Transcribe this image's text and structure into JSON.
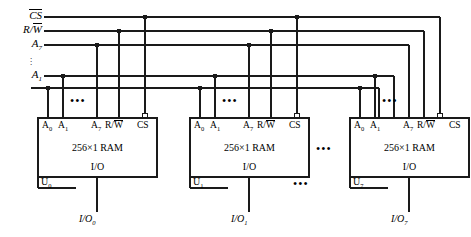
{
  "diagram": {
    "ink_color": "#1a1a1a",
    "bus_labels": [
      {
        "id": "cs",
        "text": "CS",
        "overbar_all": true,
        "y": 17
      },
      {
        "id": "rw",
        "text": "R/W",
        "overbar_w": true,
        "y": 31
      },
      {
        "id": "a7",
        "text": "A",
        "sub": "7",
        "y": 45
      },
      {
        "id": "a1",
        "text": "A",
        "sub": "1",
        "y": 76
      }
    ],
    "vertical_dots": "⋮",
    "vdots_glyph": ".",
    "blocks": [
      {
        "id": "u0",
        "ref": "U",
        "ref_sub": "0",
        "body": "256×1 RAM",
        "io_text": "I/O",
        "out_label": "I/O",
        "out_sub": "0",
        "pins": [
          "A",
          "A",
          "A",
          "R/W",
          "CS"
        ],
        "pin_labels": [
          {
            "text": "A",
            "sub": "0"
          },
          {
            "text": "A",
            "sub": "1"
          },
          {
            "text": "A",
            "sub": "7"
          },
          {
            "text": "R/W",
            "overbar_w": true
          },
          {
            "text": "CS",
            "bubble": true
          }
        ],
        "x": 38,
        "y": 118,
        "w": 119,
        "h": 59
      },
      {
        "id": "u1",
        "ref": "U",
        "ref_sub": "1",
        "body": "256×1 RAM",
        "io_text": "I/O",
        "out_label": "I/O",
        "out_sub": "1",
        "pin_labels": [
          {
            "text": "A",
            "sub": "0"
          },
          {
            "text": "A",
            "sub": "1"
          },
          {
            "text": "A",
            "sub": "7"
          },
          {
            "text": "R/W",
            "overbar_w": true
          },
          {
            "text": "CS",
            "bubble": true
          }
        ],
        "x": 190,
        "y": 118,
        "w": 119,
        "h": 59
      },
      {
        "id": "u7",
        "ref": "U",
        "ref_sub": "7",
        "body": "256×1 RAM",
        "io_text": "I/O",
        "out_label": "I/O",
        "out_sub": "7",
        "pin_labels": [
          {
            "text": "A",
            "sub": "0"
          },
          {
            "text": "A",
            "sub": "1"
          },
          {
            "text": "A",
            "sub": "7"
          },
          {
            "text": "R/W",
            "overbar_w": true
          },
          {
            "text": "CS",
            "bubble": true
          }
        ],
        "x": 350,
        "y": 118,
        "w": 119,
        "h": 59
      }
    ],
    "ellipses": {
      "inside_pins": "•••",
      "between_blocks_mid": "•••",
      "between_blocks_low": "•••",
      "text": "..."
    }
  }
}
